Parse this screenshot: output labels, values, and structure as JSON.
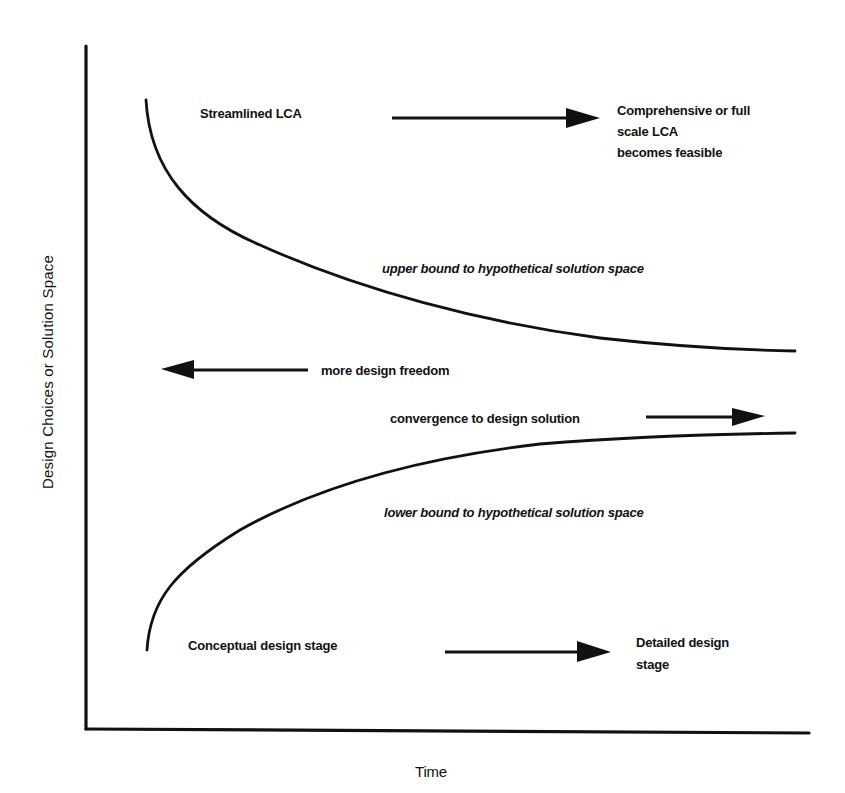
{
  "diagram": {
    "type": "conceptual-funnel",
    "axes": {
      "x_label": "Time",
      "y_label": "Design Choices or Solution Space"
    },
    "labels": {
      "streamlined_lca": "Streamlined LCA",
      "comprehensive_lca": "Comprehensive or full\nscale LCA\nbecomes feasible",
      "upper_bound": "upper bound to hypothetical solution space",
      "more_design_freedom": "more design freedom",
      "convergence": "convergence to design solution",
      "lower_bound": "lower bound to hypothetical solution space",
      "conceptual_stage": "Conceptual design stage",
      "detailed_stage": "Detailed design\nstage"
    },
    "curves": {
      "upper_bound": [
        [
          146,
          100
        ],
        [
          155,
          140
        ],
        [
          180,
          185
        ],
        [
          220,
          225
        ],
        [
          330,
          270
        ],
        [
          450,
          310
        ],
        [
          600,
          338
        ],
        [
          795,
          351
        ]
      ],
      "lower_bound": [
        [
          147,
          650
        ],
        [
          155,
          605
        ],
        [
          180,
          575
        ],
        [
          240,
          530
        ],
        [
          340,
          483
        ],
        [
          450,
          455
        ],
        [
          560,
          442
        ],
        [
          795,
          433
        ]
      ]
    },
    "arrows": [
      {
        "name": "streamlined-to-comprehensive",
        "direction": "right",
        "from": [
          392,
          118
        ],
        "to": [
          600,
          118
        ]
      },
      {
        "name": "more-design-freedom",
        "direction": "left",
        "from": [
          308,
          370
        ],
        "to": [
          161,
          370
        ]
      },
      {
        "name": "convergence",
        "direction": "right",
        "from": [
          646,
          417
        ],
        "to": [
          765,
          417
        ]
      },
      {
        "name": "conceptual-to-detailed",
        "direction": "right",
        "from": [
          445,
          652
        ],
        "to": [
          611,
          652
        ]
      }
    ],
    "colors": {
      "ink": "#111111",
      "background": "#ffffff"
    }
  }
}
